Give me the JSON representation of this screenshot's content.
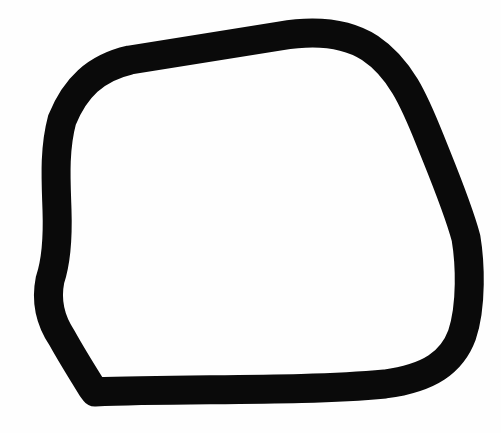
{
  "drawing": {
    "description": "Hand-drawn closed loop outline",
    "background_color": "#fefefe",
    "stroke_color": "#0a0a0a",
    "stroke_width": 29,
    "path": "M 95 392 C 180 388, 300 392, 385 384 C 430 378, 452 362, 462 335 C 472 305, 470 262, 466 238 C 458 208, 444 175, 430 140 C 414 100, 400 68, 370 48 C 345 32, 315 30, 280 36 C 230 44, 180 52, 130 60 C 95 68, 75 88, 62 120 C 54 150, 56 180, 57 210 C 58 240, 56 262, 50 280 C 46 300, 50 320, 62 338 C 72 356, 82 372, 92 388 Z"
  }
}
